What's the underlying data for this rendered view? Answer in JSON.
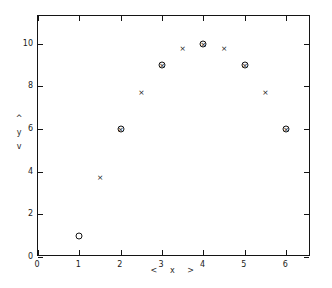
{
  "chart_data": {
    "type": "scatter",
    "title": "",
    "xlabel": "<  x  >",
    "ylabel": "< y >",
    "ylabel_chars": [
      "^",
      "y",
      "v"
    ],
    "xlim": [
      0,
      6.6
    ],
    "ylim": [
      0,
      11.3
    ],
    "xticks": [
      0,
      1,
      2,
      3,
      4,
      5,
      6
    ],
    "yticks": [
      0,
      2,
      4,
      6,
      8,
      10
    ],
    "xticklabels": [
      "0",
      "1",
      "2",
      "3",
      "4",
      "5",
      "6"
    ],
    "yticklabels": [
      "0",
      "2",
      "4",
      "6",
      "8",
      "10"
    ],
    "grid": false,
    "legend": "none",
    "frame": true,
    "marker_color": "#141414",
    "background": "#ffffff",
    "series": [
      {
        "name": "circles",
        "marker": "open-circle",
        "points": [
          {
            "x": 1,
            "y": 1
          },
          {
            "x": 2,
            "y": 6
          },
          {
            "x": 3,
            "y": 9
          },
          {
            "x": 4,
            "y": 10
          },
          {
            "x": 5,
            "y": 9
          },
          {
            "x": 6,
            "y": 6
          }
        ]
      },
      {
        "name": "crosses",
        "marker": "x",
        "points": [
          {
            "x": 1.5,
            "y": 3.75
          },
          {
            "x": 2,
            "y": 6
          },
          {
            "x": 2.5,
            "y": 7.75
          },
          {
            "x": 3,
            "y": 9
          },
          {
            "x": 3.5,
            "y": 9.8
          },
          {
            "x": 4,
            "y": 10
          },
          {
            "x": 4.5,
            "y": 9.8
          },
          {
            "x": 5,
            "y": 9
          },
          {
            "x": 5.5,
            "y": 7.75
          },
          {
            "x": 6,
            "y": 6
          }
        ]
      }
    ]
  }
}
